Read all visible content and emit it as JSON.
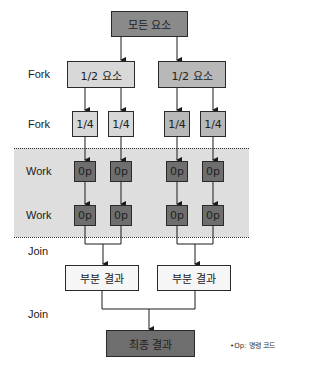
{
  "diagram": {
    "root": {
      "label": "모든 요소",
      "color": "#8a8a8a"
    },
    "halves": [
      {
        "label": "1/2 요소",
        "color": "#d8d8d8"
      },
      {
        "label": "1/2 요소",
        "color": "#b8b8b8"
      }
    ],
    "quarters": [
      {
        "label": "1/4",
        "color": "#d8d8d8"
      },
      {
        "label": "1/4",
        "color": "#d8d8d8"
      },
      {
        "label": "1/4",
        "color": "#b8b8b8"
      },
      {
        "label": "1/4",
        "color": "#b8b8b8"
      }
    ],
    "ops_row1": [
      "0p",
      "0p",
      "0p",
      "0p"
    ],
    "ops_row2": [
      "0p",
      "0p",
      "0p",
      "0p"
    ],
    "op_color": "#6e6e6e",
    "partials": [
      {
        "label": "부분 결과"
      },
      {
        "label": "부분 결과"
      }
    ],
    "final": {
      "label": "최종 결과",
      "color": "#6e6e6e"
    },
    "stage_labels": [
      "Fork",
      "Fork",
      "Work",
      "Work",
      "Join",
      "Join"
    ],
    "footnote": "•Op: 명령 코드",
    "shaded_region_color": "#dedede"
  }
}
